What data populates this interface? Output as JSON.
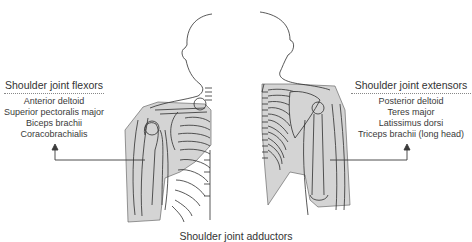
{
  "diagram": {
    "colors": {
      "muscle_fill": "#d4d4d4",
      "outline": "#2e2e2e",
      "text": "#333333",
      "arrow": "#3a3a3a",
      "background": "#ffffff"
    },
    "figures": [
      {
        "view": "anterior",
        "side": "left"
      },
      {
        "view": "posterior",
        "side": "right"
      }
    ],
    "labels": {
      "flexors": {
        "title": "Shoulder joint flexors",
        "items": [
          "Anterior deltoid",
          "Superior pectoralis major",
          "Biceps brachii",
          "Coracobrachialis"
        ]
      },
      "extensors": {
        "title": "Shoulder joint extensors",
        "items": [
          "Posterior deltoid",
          "Teres major",
          "Latissimus dorsi",
          "Triceps brachii (long head)"
        ]
      },
      "adductors": {
        "title": "Shoulder joint adductors"
      }
    }
  }
}
